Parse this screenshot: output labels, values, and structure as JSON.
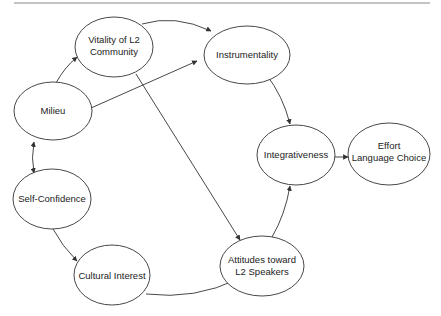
{
  "diagram": {
    "type": "path-model",
    "colors": {
      "stroke": "#333333",
      "text": "#222222",
      "rule": "#8a8a8a",
      "background": "#ffffff"
    },
    "nodes": [
      {
        "id": "vitality",
        "lines": [
          "Vitality of L2",
          "Community"
        ]
      },
      {
        "id": "instrumentality",
        "lines": [
          "Instrumentality"
        ]
      },
      {
        "id": "milieu",
        "lines": [
          "Milieu"
        ]
      },
      {
        "id": "integrativeness",
        "lines": [
          "Integrativeness"
        ]
      },
      {
        "id": "effort",
        "lines": [
          "Effort",
          "Language Choice"
        ]
      },
      {
        "id": "selfconfidence",
        "lines": [
          "Self-Confidence"
        ]
      },
      {
        "id": "cultural",
        "lines": [
          "Cultural Interest"
        ]
      },
      {
        "id": "attitudes",
        "lines": [
          "Attitudes toward",
          "L2 Speakers"
        ]
      }
    ],
    "edges": [
      {
        "from": "milieu",
        "to": "vitality"
      },
      {
        "from": "milieu",
        "to": "instrumentality"
      },
      {
        "from": "milieu",
        "to": "selfconfidence",
        "bidirectional": true
      },
      {
        "from": "vitality",
        "to": "instrumentality"
      },
      {
        "from": "vitality",
        "to": "attitudes"
      },
      {
        "from": "instrumentality",
        "to": "integrativeness"
      },
      {
        "from": "integrativeness",
        "to": "effort"
      },
      {
        "from": "selfconfidence",
        "to": "cultural"
      },
      {
        "from": "cultural",
        "to": "attitudes"
      },
      {
        "from": "attitudes",
        "to": "integrativeness"
      }
    ]
  }
}
